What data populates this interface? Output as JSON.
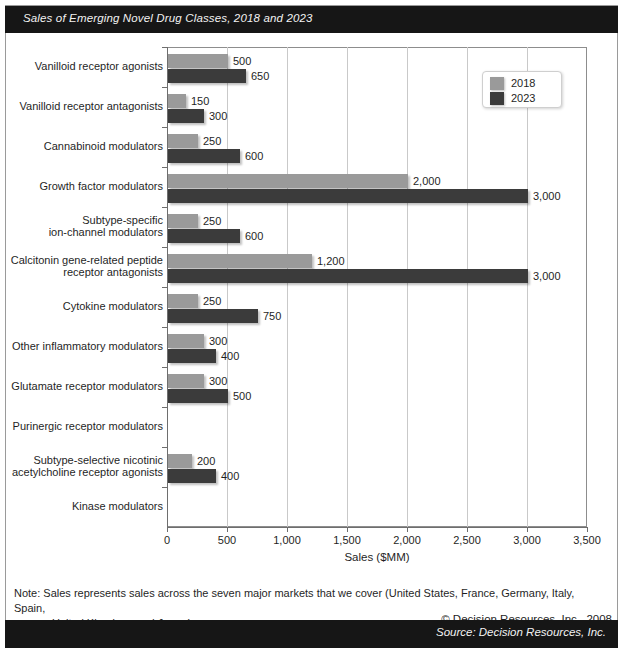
{
  "header": {
    "title": "Sales of Emerging Novel Drug Classes, 2018 and 2023"
  },
  "footer": {
    "source": "Source: Decision Resources, Inc.",
    "copyright": "© Decision Resources, Inc., 2008",
    "note_line1": "Note: Sales represents sales across the seven major markets that we cover (United States, France, Germany, Italy, Spain,",
    "note_line2": "United Kingdom, and Japan)."
  },
  "colors": {
    "series_2018": "#9a9a9a",
    "series_2023": "#3b3b3b",
    "band": "#161616",
    "frame": "#9a9a9a",
    "grid": "#c9c9c9"
  },
  "chart_data": {
    "type": "bar",
    "orientation": "horizontal",
    "title": "Sales of Emerging Novel Drug Classes, 2018 and 2023",
    "xlabel": "Sales ($MM)",
    "ylabel": "",
    "xlim": [
      0,
      3500
    ],
    "xticks": [
      0,
      500,
      1000,
      1500,
      2000,
      2500,
      3000,
      3500
    ],
    "xticklabels": [
      "0",
      "500",
      "1,000",
      "1,500",
      "2,000",
      "2,500",
      "3,000",
      "3,500"
    ],
    "grid": true,
    "legend_position": "top-right",
    "categories": [
      "Vanilloid receptor agonists",
      "Vanilloid receptor antagonists",
      "Cannabinoid modulators",
      "Growth factor modulators",
      "Subtype-specific\nion-channel modulators",
      "Calcitonin gene-related peptide\nreceptor antagonists",
      "Cytokine modulators",
      "Other inflammatory modulators",
      "Glutamate receptor modulators",
      "Purinergic receptor modulators",
      "Subtype-selective nicotinic\nacetylcholine receptor agonists",
      "Kinase modulators"
    ],
    "series": [
      {
        "name": "2018",
        "color": "#9a9a9a",
        "values": [
          500,
          150,
          250,
          2000,
          250,
          1200,
          250,
          300,
          300,
          null,
          200,
          null
        ],
        "labels": [
          "500",
          "150",
          "250",
          "2,000",
          "250",
          "1,200",
          "250",
          "300",
          "300",
          "",
          "200",
          ""
        ]
      },
      {
        "name": "2023",
        "color": "#3b3b3b",
        "values": [
          650,
          300,
          600,
          3000,
          600,
          3000,
          750,
          400,
          500,
          null,
          400,
          null
        ],
        "labels": [
          "650",
          "300",
          "600",
          "3,000",
          "600",
          "3,000",
          "750",
          "400",
          "500",
          "",
          "400",
          ""
        ]
      }
    ]
  }
}
